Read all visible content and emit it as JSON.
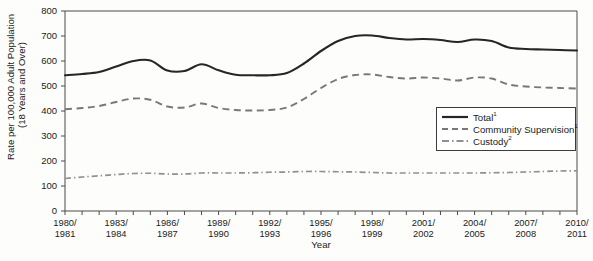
{
  "chart_data": {
    "type": "line",
    "title": "",
    "xlabel": "Year",
    "ylabel": "Rate per 100,000 Adult Population (18 Years and Over)",
    "ylabel_line1": "Rate per 100,000 Adult Population",
    "ylabel_line2": "(18 Years and Over)",
    "ylim": [
      0,
      800
    ],
    "ytick_labels": [
      "0",
      "100",
      "200",
      "300",
      "400",
      "500",
      "600",
      "700",
      "800"
    ],
    "ytick_values": [
      0,
      100,
      200,
      300,
      400,
      500,
      600,
      700,
      800
    ],
    "grid": false,
    "legend_position": "center-right",
    "x": [
      "1980/1981",
      "1981/1982",
      "1982/1983",
      "1983/1984",
      "1984/1985",
      "1985/1986",
      "1986/1987",
      "1987/1988",
      "1988/1989",
      "1989/1990",
      "1990/1991",
      "1991/1992",
      "1992/1993",
      "1993/1994",
      "1994/1995",
      "1995/1996",
      "1996/1997",
      "1997/1998",
      "1998/1999",
      "1999/2000",
      "2000/2001",
      "2001/2002",
      "2002/2003",
      "2003/2004",
      "2004/2005",
      "2005/2006",
      "2006/2007",
      "2007/2008",
      "2008/2009",
      "2009/2010",
      "2010/2011"
    ],
    "xtick_labels": [
      {
        "line1": "1980/",
        "line2": "1981",
        "index": 0
      },
      {
        "line1": "1983/",
        "line2": "1984",
        "index": 3
      },
      {
        "line1": "1986/",
        "line2": "1987",
        "index": 6
      },
      {
        "line1": "1989/",
        "line2": "1990",
        "index": 9
      },
      {
        "line1": "1992/",
        "line2": "1993",
        "index": 12
      },
      {
        "line1": "1995/",
        "line2": "1996",
        "index": 15
      },
      {
        "line1": "1998/",
        "line2": "1999",
        "index": 18
      },
      {
        "line1": "2001/",
        "line2": "2002",
        "index": 21
      },
      {
        "line1": "2004/",
        "line2": "2005",
        "index": 24
      },
      {
        "line1": "2007/",
        "line2": "2008",
        "index": 27
      },
      {
        "line1": "2010/",
        "line2": "2011",
        "index": 30
      }
    ],
    "series": [
      {
        "name": "Total",
        "superscript": "1",
        "style": "solid",
        "color": "#262626",
        "values": [
          543,
          548,
          556,
          578,
          600,
          602,
          562,
          560,
          587,
          563,
          545,
          543,
          543,
          552,
          590,
          640,
          680,
          700,
          702,
          692,
          686,
          688,
          684,
          676,
          686,
          680,
          654,
          648,
          646,
          644,
          642
        ]
      },
      {
        "name": "Community Supervision",
        "superscript": "1",
        "style": "dashed",
        "color": "#787878",
        "values": [
          407,
          412,
          420,
          436,
          450,
          445,
          418,
          414,
          430,
          412,
          404,
          402,
          404,
          414,
          448,
          492,
          528,
          544,
          546,
          536,
          530,
          534,
          530,
          522,
          534,
          530,
          506,
          498,
          494,
          492,
          490
        ]
      },
      {
        "name": "Custody",
        "superscript": "2",
        "style": "dash-dot",
        "color": "#909090",
        "values": [
          130,
          136,
          141,
          146,
          150,
          151,
          148,
          148,
          152,
          152,
          152,
          153,
          155,
          156,
          158,
          158,
          157,
          156,
          154,
          152,
          152,
          152,
          152,
          152,
          152,
          153,
          154,
          156,
          158,
          160,
          161
        ]
      }
    ]
  },
  "legend": {
    "entries": [
      {
        "label": "Total",
        "sup": "1",
        "icon": "solid-line-icon"
      },
      {
        "label": "Community Supervision",
        "sup": "1",
        "icon": "dashed-line-icon"
      },
      {
        "label": "Custody",
        "sup": "2",
        "icon": "dash-dot-line-icon"
      }
    ]
  }
}
